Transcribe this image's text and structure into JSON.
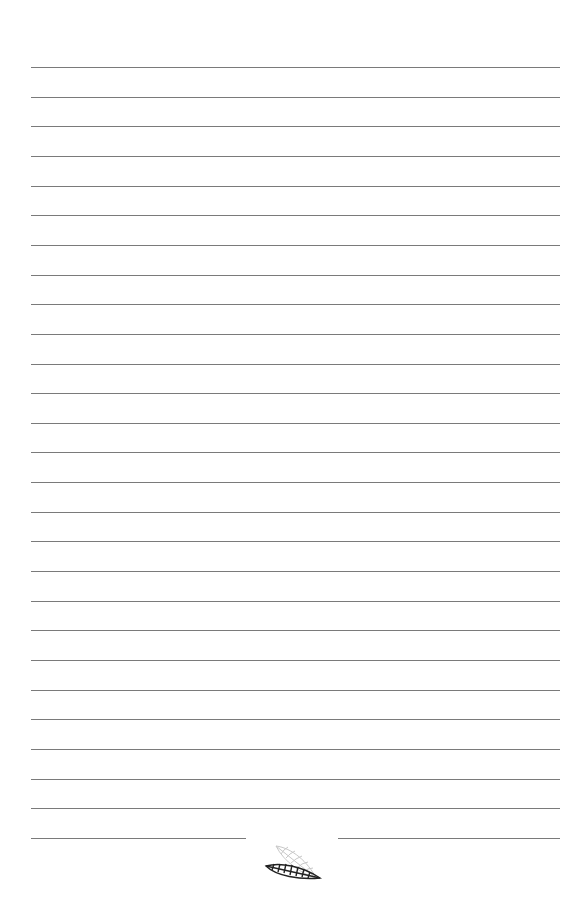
{
  "page": {
    "type": "lined-notebook-page",
    "background": "#ffffff",
    "rule_color": "#7a7a7a",
    "rule_count": 27,
    "rule_left": 31,
    "rule_right": 560,
    "first_rule_y": 67,
    "rule_spacing": 29.65,
    "footer": {
      "ornament_icon": "leaf-ornament-icon",
      "left_segment_end": 246,
      "right_segment_start": 338
    }
  }
}
